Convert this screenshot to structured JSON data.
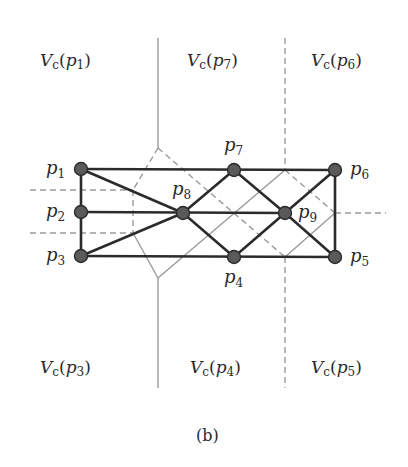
{
  "figure": {
    "caption": "(b)",
    "colors": {
      "edge": "#2b2b2b",
      "node_fill": "#5a5a5a",
      "node_stroke": "#2b2b2b",
      "voronoi": "#9a9a9a",
      "text": "#2a2a2a"
    },
    "regions": [
      {
        "id": "p1",
        "main": "V",
        "sub": "c",
        "arg": "p",
        "argsub": "1"
      },
      {
        "id": "p7",
        "main": "V",
        "sub": "c",
        "arg": "p",
        "argsub": "7"
      },
      {
        "id": "p6",
        "main": "V",
        "sub": "c",
        "arg": "p",
        "argsub": "6"
      },
      {
        "id": "p3",
        "main": "V",
        "sub": "c",
        "arg": "p",
        "argsub": "3"
      },
      {
        "id": "p4",
        "main": "V",
        "sub": "c",
        "arg": "p",
        "argsub": "4"
      },
      {
        "id": "p5",
        "main": "V",
        "sub": "c",
        "arg": "p",
        "argsub": "5"
      }
    ],
    "nodes": [
      {
        "id": "p1",
        "label": "p",
        "sub": "1"
      },
      {
        "id": "p2",
        "label": "p",
        "sub": "2"
      },
      {
        "id": "p3",
        "label": "p",
        "sub": "3"
      },
      {
        "id": "p4",
        "label": "p",
        "sub": "4"
      },
      {
        "id": "p5",
        "label": "p",
        "sub": "5"
      },
      {
        "id": "p6",
        "label": "p",
        "sub": "6"
      },
      {
        "id": "p7",
        "label": "p",
        "sub": "7"
      },
      {
        "id": "p8",
        "label": "p",
        "sub": "8"
      },
      {
        "id": "p9",
        "label": "p",
        "sub": "9"
      }
    ],
    "edges": [
      [
        "p1",
        "p7"
      ],
      [
        "p7",
        "p6"
      ],
      [
        "p3",
        "p4"
      ],
      [
        "p4",
        "p5"
      ],
      [
        "p6",
        "p5"
      ],
      [
        "p1",
        "p2"
      ],
      [
        "p2",
        "p3"
      ],
      [
        "p1",
        "p8"
      ],
      [
        "p2",
        "p8"
      ],
      [
        "p3",
        "p8"
      ],
      [
        "p8",
        "p7"
      ],
      [
        "p8",
        "p4"
      ],
      [
        "p8",
        "p9"
      ],
      [
        "p7",
        "p9"
      ],
      [
        "p4",
        "p9"
      ],
      [
        "p9",
        "p6"
      ],
      [
        "p9",
        "p5"
      ]
    ]
  }
}
